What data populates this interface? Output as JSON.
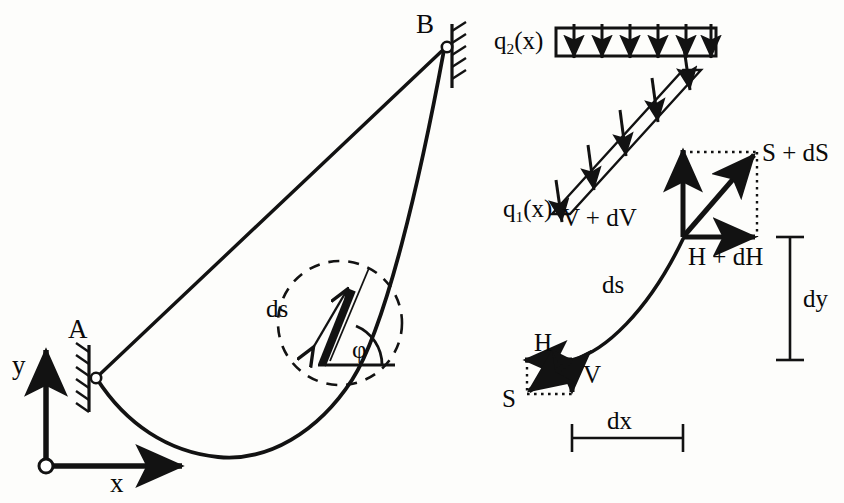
{
  "figure": {
    "stroke_color": "#121212",
    "background_color": "#fdfdfb"
  },
  "left_panel": {
    "name": "suspended-cable-overview",
    "support_a_label": "A",
    "support_b_label": "B",
    "axis_y_label": "y",
    "axis_x_label": "x",
    "detail_ds_label": "ds",
    "detail_angle_label": "φ",
    "geometry": {
      "point_a": [
        96,
        378
      ],
      "point_b": [
        446,
        46
      ],
      "origin": [
        46,
        466
      ],
      "y_axis_tip": [
        46,
        348
      ],
      "x_axis_tip": [
        186,
        466
      ],
      "detail_circle_center": [
        340,
        323
      ],
      "detail_circle_radius": 62
    }
  },
  "right_panel": {
    "name": "element-free-body-diagram",
    "load_q2_label_base": "q",
    "load_q2_label_sub": "2",
    "load_q2_label_arg": "(x)",
    "load_q1_label_base": "q",
    "load_q1_label_sub": "1",
    "load_q1_label_arg": "(x)",
    "force_v_plus_dv": "V + dV",
    "force_h_plus_dh": "H + dH",
    "force_s_plus_ds": "S + dS",
    "force_h": "H",
    "force_v": "V",
    "force_s": "S",
    "element_length_label": "ds",
    "dim_dx_label": "dx",
    "dim_dy_label": "dy",
    "q2_arrow_count": 6,
    "q1_arrow_count": 5,
    "geometry": {
      "upper_node": [
        683,
        237
      ],
      "lower_node": [
        572,
        360
      ],
      "q2_box": [
        556,
        28,
        160,
        28
      ],
      "dx_line_y": 438,
      "dx_line_x1": 572,
      "dx_line_x2": 683,
      "dy_line_x": 790,
      "dy_line_y1": 237,
      "dy_line_y2": 360
    }
  }
}
